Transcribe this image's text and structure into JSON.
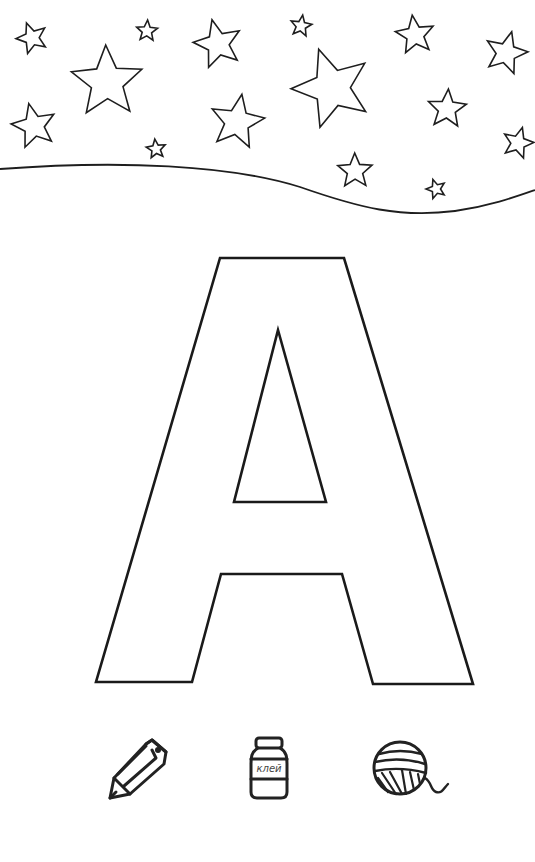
{
  "page": {
    "type": "coloring-worksheet",
    "letter": "A",
    "background": "#ffffff",
    "line_color": "#1e1e1e"
  },
  "header_decoration": {
    "description": "sky with outlined stars above a wavy horizon line",
    "stars": [
      {
        "cx": 32,
        "cy": 38,
        "r": 16
      },
      {
        "cx": 147,
        "cy": 31,
        "r": 11
      },
      {
        "cx": 218,
        "cy": 44,
        "r": 25
      },
      {
        "cx": 301,
        "cy": 26,
        "r": 11
      },
      {
        "cx": 415,
        "cy": 35,
        "r": 20
      },
      {
        "cx": 506,
        "cy": 53,
        "r": 22
      },
      {
        "cx": 107,
        "cy": 82,
        "r": 37
      },
      {
        "cx": 332,
        "cy": 88,
        "r": 41
      },
      {
        "cx": 447,
        "cy": 109,
        "r": 20
      },
      {
        "cx": 34,
        "cy": 126,
        "r": 23
      },
      {
        "cx": 237,
        "cy": 122,
        "r": 28
      },
      {
        "cx": 156,
        "cy": 149,
        "r": 10
      },
      {
        "cx": 518,
        "cy": 143,
        "r": 16
      },
      {
        "cx": 355,
        "cy": 171,
        "r": 18
      },
      {
        "cx": 436,
        "cy": 189,
        "r": 10
      }
    ]
  },
  "icons": {
    "pencil": {
      "name": "pencil",
      "hint": "color with pencils"
    },
    "glue": {
      "name": "glue-jar",
      "label": "клей"
    },
    "yarn": {
      "name": "yarn-ball",
      "hint": "decorate with yarn"
    }
  }
}
